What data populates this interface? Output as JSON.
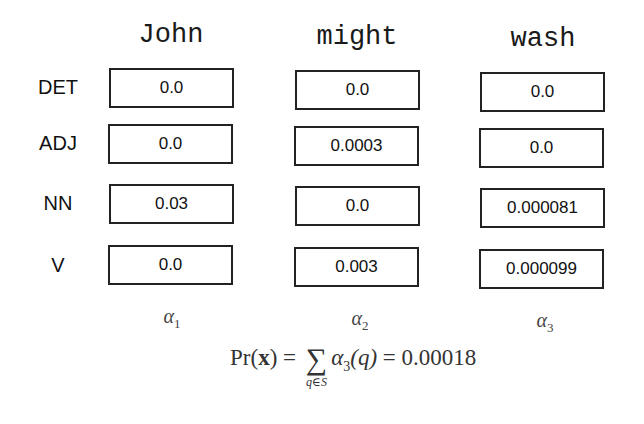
{
  "columns": [
    {
      "word": "John",
      "alpha_symbol": "α",
      "alpha_index": "1"
    },
    {
      "word": "might",
      "alpha_symbol": "α",
      "alpha_index": "2"
    },
    {
      "word": "wash",
      "alpha_symbol": "α",
      "alpha_index": "3"
    }
  ],
  "rows": [
    {
      "tag": "DET",
      "values": [
        "0.0",
        "0.0",
        "0.0"
      ]
    },
    {
      "tag": "ADJ",
      "values": [
        "0.0",
        "0.0003",
        "0.0"
      ]
    },
    {
      "tag": "NN",
      "values": [
        "0.03",
        "0.0",
        "0.000081"
      ]
    },
    {
      "tag": "V",
      "values": [
        "0.0",
        "0.003",
        "0.000099"
      ]
    }
  ],
  "formula": {
    "lhs_func": "Pr(",
    "lhs_var": "x",
    "lhs_close": ")",
    "eq1": " = ",
    "sigma": "∑",
    "sum_under": "q∈S",
    "term_symbol": "α",
    "term_index": "3",
    "term_arg": "(q)",
    "eq2": " = ",
    "result": "0.00018"
  }
}
